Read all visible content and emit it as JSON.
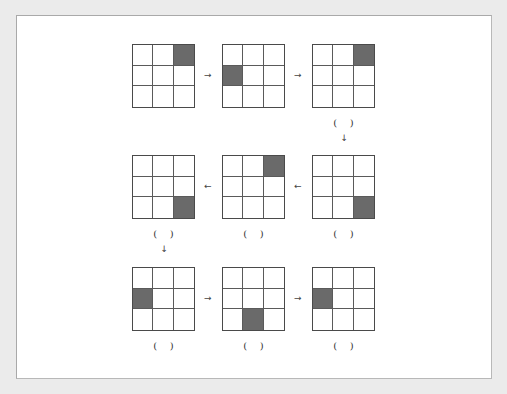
{
  "diagram": {
    "type": "3x3 grid sequence puzzle",
    "colors": {
      "filled": "#6a6a6a",
      "line": "#4a4a4a",
      "background": "#ffffff",
      "page": "#ebebeb"
    },
    "rows": [
      {
        "direction": "right",
        "arrow_glyph": "→",
        "grids": [
          {
            "filled": [
              [
                0,
                2
              ]
            ],
            "answer_blank": false
          },
          {
            "filled": [
              [
                1,
                0
              ]
            ],
            "answer_blank": false
          },
          {
            "filled": [
              [
                0,
                2
              ]
            ],
            "answer_blank": true
          }
        ]
      },
      {
        "direction": "left",
        "arrow_glyph": "←",
        "grids": [
          {
            "filled": [
              [
                2,
                2
              ]
            ],
            "answer_blank": true
          },
          {
            "filled": [
              [
                0,
                2
              ]
            ],
            "answer_blank": true
          },
          {
            "filled": [
              [
                2,
                2
              ]
            ],
            "answer_blank": true
          }
        ]
      },
      {
        "direction": "right",
        "arrow_glyph": "→",
        "grids": [
          {
            "filled": [
              [
                1,
                0
              ]
            ],
            "answer_blank": true
          },
          {
            "filled": [
              [
                2,
                1
              ]
            ],
            "answer_blank": true
          },
          {
            "filled": [
              [
                1,
                0
              ]
            ],
            "answer_blank": true
          }
        ]
      }
    ],
    "down_arrow_glyph": "↓",
    "answer_blank_text": "(    )"
  }
}
